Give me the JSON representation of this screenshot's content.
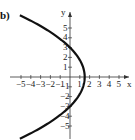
{
  "panel_label": "b)",
  "chart_data": {
    "type": "line",
    "title": "",
    "xlabel": "x",
    "ylabel": "y",
    "xlim": [
      -5.5,
      6
    ],
    "ylim": [
      -6,
      6
    ],
    "grid": false,
    "x_ticks": [
      -5,
      -4,
      -3,
      -2,
      -1,
      1,
      2,
      3,
      4,
      5
    ],
    "y_ticks": [
      5,
      4,
      3,
      2,
      1,
      -1,
      -2,
      -3,
      -4,
      -5
    ],
    "series": [
      {
        "name": "parabola x = 1.5 - y^2/6",
        "description": "Parabola opening left, vertex at (1.5, 0), y-intercepts at (0, 3) and (0, -3)",
        "vertex": [
          1.5,
          0
        ],
        "y_intercepts": [
          3,
          -3
        ],
        "points": [
          [
            -4.9,
            6.2
          ],
          [
            -3.5,
            5.5
          ],
          [
            -1.5,
            4.24
          ],
          [
            0,
            3
          ],
          [
            1,
            1.73
          ],
          [
            1.5,
            0
          ],
          [
            1,
            -1.73
          ],
          [
            0,
            -3
          ],
          [
            -1.5,
            -4.24
          ],
          [
            -3.5,
            -5.5
          ],
          [
            -4.9,
            -6.2
          ]
        ]
      }
    ]
  }
}
